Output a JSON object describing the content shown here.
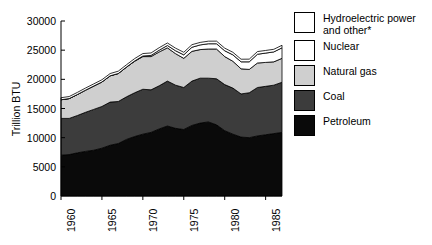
{
  "chart_data": {
    "type": "area",
    "stacked": true,
    "title": "",
    "xlabel": "",
    "ylabel": "Trillion BTU",
    "xlim": [
      1960,
      1987
    ],
    "ylim": [
      0,
      30000
    ],
    "ytick_labels": [
      "30000",
      "25000",
      "20000",
      "15000",
      "10000",
      "5000",
      "0"
    ],
    "ytick_values": [
      30000,
      25000,
      20000,
      15000,
      10000,
      5000,
      0
    ],
    "xtick_labels": [
      "1960",
      "1965",
      "1970",
      "1975",
      "1980",
      "1985"
    ],
    "xtick_values": [
      1960,
      1965,
      1970,
      1975,
      1980,
      1985
    ],
    "grid": false,
    "legend_position": "right",
    "x": [
      1960,
      1961,
      1962,
      1963,
      1964,
      1965,
      1966,
      1967,
      1968,
      1969,
      1970,
      1971,
      1972,
      1973,
      1974,
      1975,
      1976,
      1977,
      1978,
      1979,
      1980,
      1981,
      1982,
      1983,
      1984,
      1985,
      1986,
      1987
    ],
    "series": [
      {
        "name": "Petroleum",
        "color": "#0a0a0a",
        "values": [
          7000,
          7100,
          7400,
          7650,
          7850,
          8200,
          8700,
          9000,
          9700,
          10200,
          10600,
          10900,
          11500,
          12000,
          11600,
          11400,
          12100,
          12500,
          12700,
          12200,
          11200,
          10600,
          10100,
          10000,
          10300,
          10500,
          10700,
          10900
        ]
      },
      {
        "name": "Coal",
        "color": "#3c3c3c",
        "values": [
          6300,
          6200,
          6400,
          6700,
          7000,
          7150,
          7400,
          7200,
          7300,
          7500,
          7700,
          7300,
          7400,
          7700,
          7400,
          7200,
          7600,
          7700,
          7500,
          7900,
          7900,
          7900,
          7400,
          7700,
          8300,
          8300,
          8300,
          8600
        ]
      },
      {
        "name": "Natural gas",
        "color": "#cfcfcf",
        "values": [
          3200,
          3400,
          3600,
          3800,
          4000,
          4200,
          4500,
          4800,
          5100,
          5400,
          5600,
          5700,
          5800,
          5700,
          5400,
          5000,
          5100,
          4900,
          5000,
          5100,
          4800,
          4600,
          4300,
          4000,
          4200,
          4100,
          4000,
          4100
        ]
      },
      {
        "name": "Nuclear",
        "color": "#ffffff",
        "values": [
          0,
          0,
          0,
          0,
          0,
          0,
          0,
          0,
          0,
          50,
          100,
          200,
          300,
          400,
          500,
          600,
          700,
          800,
          900,
          900,
          1000,
          1100,
          1200,
          1300,
          1500,
          1600,
          1700,
          1800
        ]
      },
      {
        "name": "Hydroelectric power and other*",
        "color": "#ffffff",
        "values": [
          350,
          350,
          360,
          360,
          370,
          380,
          390,
          400,
          400,
          410,
          420,
          420,
          430,
          430,
          440,
          440,
          440,
          430,
          440,
          450,
          450,
          440,
          450,
          460,
          460,
          450,
          450,
          440
        ]
      }
    ]
  },
  "legend": {
    "items": [
      {
        "label": "Hydroelectric power\nand other*",
        "swatch": "#ffffff"
      },
      {
        "label": "Nuclear",
        "swatch": "#ffffff"
      },
      {
        "label": "Natural gas",
        "swatch": "#cfcfcf"
      },
      {
        "label": "Coal",
        "swatch": "#3c3c3c"
      },
      {
        "label": "Petroleum",
        "swatch": "#0a0a0a"
      }
    ]
  },
  "axis": {
    "y_title": "Trillion BTU"
  }
}
